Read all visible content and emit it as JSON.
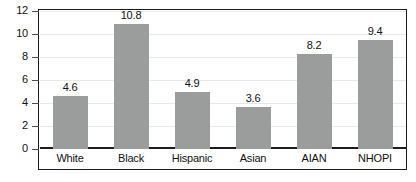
{
  "chart_data": {
    "type": "bar",
    "title": "",
    "subtitle": "",
    "xlabel": "",
    "ylabel": "",
    "categories": [
      "White",
      "Black",
      "Hispanic",
      "Asian",
      "AIAN",
      "NHOPI"
    ],
    "values": [
      4.6,
      10.8,
      4.9,
      3.6,
      8.2,
      9.4
    ],
    "value_labels": [
      "4.6",
      "10.8",
      "4.9",
      "3.6",
      "8.2",
      "9.4"
    ],
    "ylim": [
      0,
      12
    ],
    "ytick_values": [
      0,
      2,
      4,
      6,
      8,
      10,
      12
    ],
    "ytick_labels": [
      "0",
      "2",
      "4",
      "6",
      "8",
      "10",
      "12"
    ],
    "grid": true,
    "legend": null,
    "legend_position": "none",
    "series": [
      {
        "name": "",
        "values": [
          4.6,
          10.8,
          4.9,
          3.6,
          8.2,
          9.4
        ]
      }
    ],
    "colors": {
      "bar_fill": "#9b9c9c",
      "gridline": "#e9e9e9",
      "axis": "#1c1c1c",
      "text": "#111111",
      "background": "#ffffff"
    }
  }
}
